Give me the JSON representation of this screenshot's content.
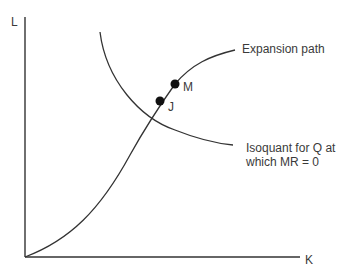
{
  "diagram": {
    "axes": {
      "y_label": "L",
      "x_label": "K"
    },
    "curves": {
      "expansion_path_label": "Expansion path",
      "isoquant_label_line1": "Isoquant for Q at",
      "isoquant_label_line2": "which MR = 0"
    },
    "points": [
      {
        "label": "M"
      },
      {
        "label": "J"
      }
    ],
    "colors": {
      "line": "#333333",
      "text": "#3a3a3a",
      "background": "#ffffff"
    }
  }
}
